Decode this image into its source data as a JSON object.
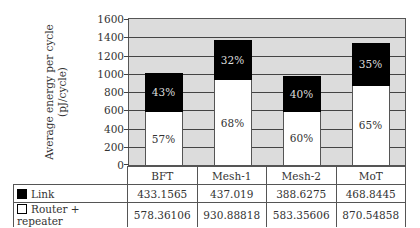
{
  "chart_data": {
    "type": "bar",
    "stacked": true,
    "title": "",
    "xlabel": "",
    "ylabel": "Average energy per cycle (pJ/cycle)",
    "ylim": [
      0,
      1600
    ],
    "yticks": [
      0,
      200,
      400,
      600,
      800,
      1000,
      1200,
      1400,
      1600
    ],
    "grid": true,
    "categories": [
      "BFT",
      "Mesh-1",
      "Mesh-2",
      "MoT"
    ],
    "series": [
      {
        "name": "Router + repeater",
        "color": "#ffffff",
        "values": [
          578.36106,
          930.88818,
          583.35606,
          870.54858
        ],
        "percent_labels": [
          "57%",
          "68%",
          "60%",
          "65%"
        ]
      },
      {
        "name": "Link",
        "color": "#000000",
        "values": [
          433.1565,
          437.019,
          388.6275,
          468.8445
        ],
        "percent_labels": [
          "43%",
          "32%",
          "40%",
          "35%"
        ]
      }
    ],
    "legend_position": "data-table-below"
  },
  "axis": {
    "ylabel_line1": "Average energy per cycle",
    "ylabel_line2": "(pJ/cycle)",
    "ticks": [
      "0",
      "200",
      "400",
      "600",
      "800",
      "1000",
      "1200",
      "1400",
      "1600"
    ]
  },
  "table": {
    "categories": [
      "BFT",
      "Mesh-1",
      "Mesh-2",
      "MoT"
    ],
    "rows": [
      {
        "label": "Link",
        "values": [
          "433.1565",
          "437.019",
          "388.6275",
          "468.8445"
        ]
      },
      {
        "label": "Router + repeater",
        "values": [
          "578.36106",
          "930.88818",
          "583.35606",
          "870.54858"
        ]
      }
    ]
  }
}
